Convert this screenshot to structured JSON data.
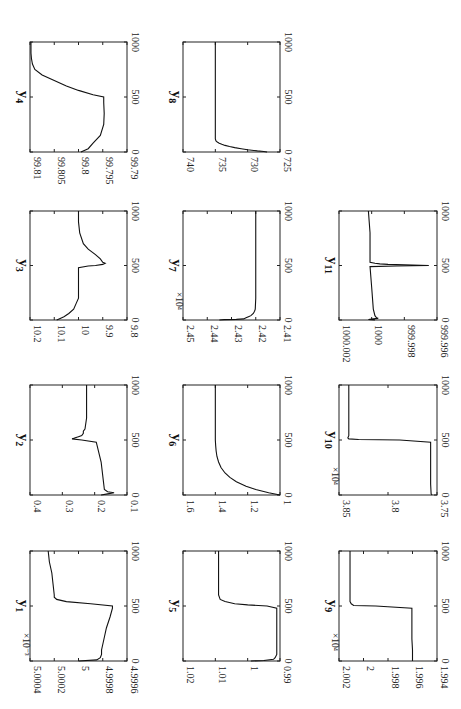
{
  "chart_data": [
    {
      "id": "y1",
      "type": "line",
      "title": "y",
      "subscript": "1",
      "xlabel": "",
      "ylabel": "",
      "xlim": [
        0,
        1000
      ],
      "xticks": [
        "0",
        "500",
        "1000"
      ],
      "ylim": [
        0.0049996,
        0.0050004
      ],
      "yticks": [
        "4.9996",
        "4.9998",
        "5",
        "5.0002",
        "5.0004"
      ],
      "exponent": "×10⁻³",
      "x": [
        0,
        10,
        30,
        60,
        100,
        200,
        300,
        400,
        480,
        500,
        520,
        540,
        560,
        580,
        600,
        700,
        800,
        900,
        1000
      ],
      "y": [
        0.005,
        0.00499985,
        0.00499982,
        0.00499981,
        0.00499981,
        0.00499979,
        0.00499977,
        0.00499974,
        0.00499972,
        0.00499972,
        0.0049999,
        0.0050001,
        0.00500018,
        0.0050002,
        0.0050002,
        0.00500021,
        0.00500022,
        0.00500024,
        0.00500025
      ]
    },
    {
      "id": "y2",
      "type": "line",
      "title": "y",
      "subscript": "2",
      "xlim": [
        0,
        1000
      ],
      "xticks": [
        "0",
        "500",
        "1000"
      ],
      "ylim": [
        0.1,
        0.4
      ],
      "yticks": [
        "0.1",
        "0.2",
        "0.3",
        "0.4"
      ],
      "x": [
        0,
        10,
        20,
        30,
        50,
        100,
        300,
        480,
        500,
        510,
        520,
        530,
        540,
        560,
        580,
        600,
        700,
        1000
      ],
      "y": [
        0.18,
        0.16,
        0.14,
        0.16,
        0.17,
        0.172,
        0.18,
        0.195,
        0.24,
        0.27,
        0.26,
        0.25,
        0.24,
        0.235,
        0.235,
        0.23,
        0.225,
        0.225
      ]
    },
    {
      "id": "y3",
      "type": "line",
      "title": "y",
      "subscript": "3",
      "xlim": [
        0,
        1000
      ],
      "xticks": [
        "0",
        "500",
        "1000"
      ],
      "ylim": [
        9.8,
        10.2
      ],
      "yticks": [
        "9.8",
        "9.9",
        "10",
        "10.1",
        "10.2"
      ],
      "x": [
        0,
        10,
        30,
        60,
        100,
        150,
        200,
        250,
        300,
        480,
        495,
        500,
        510,
        520,
        530,
        560,
        600,
        650,
        700,
        800,
        900,
        1000
      ],
      "y": [
        10.09,
        10.08,
        10.06,
        10.04,
        10.02,
        10.01,
        10.0,
        10.0,
        10.0,
        10.0,
        9.96,
        9.93,
        9.9,
        9.89,
        9.9,
        9.91,
        9.93,
        9.96,
        9.98,
        9.995,
        10.0,
        10.0
      ]
    },
    {
      "id": "y4",
      "type": "line",
      "title": "y",
      "subscript": "4",
      "xlim": [
        0,
        1000
      ],
      "xticks": [
        "0",
        "500",
        "1000"
      ],
      "ylim": [
        99.79,
        99.81
      ],
      "yticks": [
        "99.79",
        "99.795",
        "99.8",
        "99.805",
        "99.81"
      ],
      "x": [
        0,
        30,
        80,
        150,
        250,
        350,
        450,
        500,
        520,
        560,
        600,
        650,
        700,
        750,
        800,
        850,
        900,
        1000
      ],
      "y": [
        99.7995,
        99.798,
        99.797,
        99.7955,
        99.7948,
        99.7947,
        99.7948,
        99.7948,
        99.797,
        99.8,
        99.8025,
        99.805,
        99.8075,
        99.809,
        99.8095,
        99.8097,
        99.8098,
        99.8098
      ]
    },
    {
      "id": "y5",
      "type": "line",
      "title": "y",
      "subscript": "5",
      "xlim": [
        0,
        1000
      ],
      "xticks": [
        "0",
        "500",
        "1000"
      ],
      "ylim": [
        0.99,
        1.02
      ],
      "yticks": [
        "0.99",
        "1",
        "1.01",
        "1.02"
      ],
      "x": [
        0,
        5,
        15,
        30,
        60,
        100,
        200,
        300,
        480,
        500,
        510,
        520,
        540,
        560,
        600,
        700,
        800,
        1000
      ],
      "y": [
        0.999,
        0.995,
        0.992,
        0.9915,
        0.991,
        0.991,
        0.991,
        0.991,
        0.991,
        0.994,
        1.0,
        1.004,
        1.007,
        1.0085,
        1.009,
        1.009,
        1.009,
        1.009
      ]
    },
    {
      "id": "y6",
      "type": "line",
      "title": "y",
      "subscript": "6",
      "xlim": [
        0,
        1000
      ],
      "xticks": [
        "0",
        "500",
        "1000"
      ],
      "ylim": [
        1.0,
        1.6
      ],
      "yticks": [
        "1",
        "1.2",
        "1.4",
        "1.6"
      ],
      "x": [
        0,
        20,
        50,
        80,
        120,
        160,
        200,
        250,
        300,
        350,
        400,
        450,
        500,
        600,
        800,
        1000
      ],
      "y": [
        1.0,
        1.07,
        1.15,
        1.21,
        1.27,
        1.31,
        1.34,
        1.365,
        1.38,
        1.39,
        1.395,
        1.398,
        1.4,
        1.4,
        1.4,
        1.4
      ]
    },
    {
      "id": "y7",
      "type": "line",
      "title": "y",
      "subscript": "7",
      "xlim": [
        0,
        1000
      ],
      "xticks": [
        "0",
        "500",
        "1000"
      ],
      "ylim": [
        24100,
        24500
      ],
      "yticks": [
        "2.41",
        "2.42",
        "2.43",
        "2.44",
        "2.45"
      ],
      "exponent": "×10⁴",
      "x": [
        0,
        3,
        6,
        10,
        20,
        30,
        40,
        60,
        80,
        100,
        200,
        500,
        1000
      ],
      "y": [
        24350,
        24330,
        24280,
        24250,
        24240,
        24230,
        24220,
        24210,
        24205,
        24202,
        24200,
        24200,
        24200
      ]
    },
    {
      "id": "y8",
      "type": "line",
      "title": "y",
      "subscript": "8",
      "xlim": [
        0,
        1000
      ],
      "xticks": [
        "0",
        "500",
        "1000"
      ],
      "ylim": [
        725,
        740
      ],
      "yticks": [
        "725",
        "730",
        "735",
        "740"
      ],
      "x": [
        0,
        5,
        10,
        20,
        30,
        40,
        50,
        60,
        70,
        80,
        90,
        100,
        120,
        150,
        200,
        500,
        1000
      ],
      "y": [
        727,
        727.5,
        728.5,
        730,
        731,
        732,
        732.8,
        733.5,
        734,
        734.4,
        734.7,
        734.9,
        735,
        735,
        735,
        735,
        735
      ]
    },
    {
      "id": "y9",
      "type": "line",
      "title": "y",
      "subscript": "9",
      "xlim": [
        0,
        1000
      ],
      "xticks": [
        "0",
        "500",
        "1000"
      ],
      "ylim": [
        19940,
        20020
      ],
      "yticks": [
        "1.994",
        "1.996",
        "1.998",
        "2",
        "2.002"
      ],
      "exponent": "×10⁴",
      "x": [
        0,
        100,
        200,
        480,
        500,
        505,
        520,
        540,
        560,
        600,
        1000
      ],
      "y": [
        19960,
        19960,
        19960.5,
        19960.5,
        19990,
        20008,
        20010,
        20011,
        20011,
        20011,
        20011
      ]
    },
    {
      "id": "y10",
      "type": "line",
      "title": "y",
      "subscript": "10",
      "xlim": [
        0,
        1000
      ],
      "xticks": [
        "0",
        "500",
        "1000"
      ],
      "ylim": [
        37500,
        38500
      ],
      "yticks": [
        "3.75",
        "3.8",
        "3.85"
      ],
      "exponent": "×10⁴",
      "x": [
        0,
        10,
        100,
        300,
        480,
        500,
        505,
        510,
        520,
        540,
        560,
        600,
        1000
      ],
      "y": [
        37550,
        37560,
        37565,
        37565,
        37565,
        37880,
        38300,
        38400,
        38410,
        38400,
        38400,
        38400,
        38400
      ]
    },
    {
      "id": "y11",
      "type": "line",
      "title": "y",
      "subscript": "11",
      "xlim": [
        0,
        1000
      ],
      "xticks": [
        "0",
        "500",
        "1000"
      ],
      "ylim": [
        999.996,
        1000.002
      ],
      "yticks": [
        "999.996",
        "999.998",
        "1000",
        "1000.002"
      ],
      "x": [
        0,
        5,
        10,
        15,
        20,
        40,
        100,
        300,
        490,
        495,
        500,
        505,
        510,
        515,
        520,
        530,
        560,
        600,
        800,
        1000
      ],
      "y": [
        999.9998,
        1000.0002,
        999.9999,
        999.9996,
        999.9997,
        999.9998,
        999.9999,
        1000.0,
        1000.0001,
        999.9985,
        999.9965,
        999.9975,
        999.999,
        999.9995,
        999.9998,
        1000.0001,
        1000.0001,
        1000.0001,
        1000.0001,
        1000.0002
      ]
    }
  ]
}
